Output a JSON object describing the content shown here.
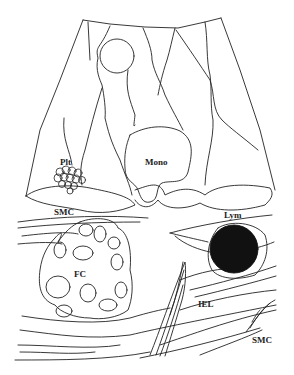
{
  "diagram": {
    "labels": {
      "plt": "Plt",
      "mono": "Mono",
      "smc_top": "SMC",
      "fc": "FC",
      "lym": "Lym",
      "iel": "IEL",
      "smc_bottom": "SMC"
    },
    "colors": {
      "line": "#222222",
      "background": "#ffffff",
      "lymphocyte_fill": "#111111"
    }
  }
}
